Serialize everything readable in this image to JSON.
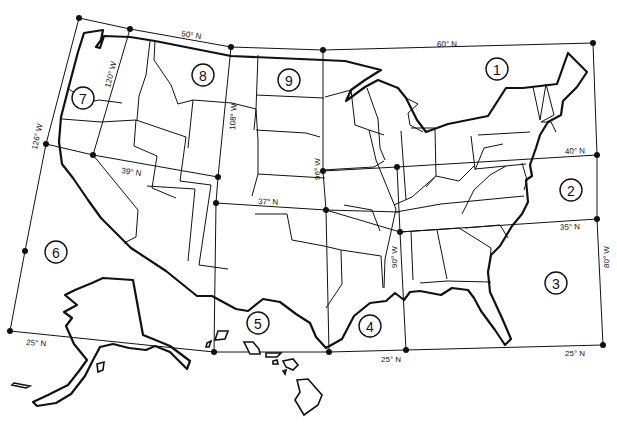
{
  "map": {
    "title": "",
    "background": "#ffffff",
    "ink_color": "#111111",
    "latitude_labels": [
      {
        "id": "lat50",
        "text": "50° N",
        "x": 181,
        "y": 36,
        "rot": 9
      },
      {
        "id": "lat60",
        "text": "60° N",
        "x": 437,
        "y": 47,
        "rot": -1
      },
      {
        "id": "lat39",
        "text": "39° N",
        "x": 121,
        "y": 173,
        "rot": 9
      },
      {
        "id": "lat37",
        "text": "37° N",
        "x": 258,
        "y": 204,
        "rot": 2
      },
      {
        "id": "lat40",
        "text": "40° N",
        "x": 565,
        "y": 154,
        "rot": -2
      },
      {
        "id": "lat35",
        "text": "35° N",
        "x": 560,
        "y": 230,
        "rot": -2
      },
      {
        "id": "lat25a",
        "text": "25° N",
        "x": 26,
        "y": 345,
        "rot": 4
      },
      {
        "id": "lat25b",
        "text": "25° N",
        "x": 381,
        "y": 362,
        "rot": 0
      },
      {
        "id": "lat25c",
        "text": "25° N",
        "x": 565,
        "y": 356,
        "rot": 0
      }
    ],
    "longitude_labels": [
      {
        "id": "lon126",
        "text": "126° W",
        "x": 37,
        "y": 150,
        "rot": -78
      },
      {
        "id": "lon120",
        "text": "120° W",
        "x": 110,
        "y": 88,
        "rot": -76
      },
      {
        "id": "lon108",
        "text": "108° W",
        "x": 235,
        "y": 130,
        "rot": 86
      },
      {
        "id": "lon96",
        "text": "96° W",
        "x": 320,
        "y": 180,
        "rot": -90
      },
      {
        "id": "lon90",
        "text": "90° W",
        "x": 397,
        "y": 268,
        "rot": 92
      },
      {
        "id": "lon80",
        "text": "80° W",
        "x": 604,
        "y": 268,
        "rot": 90
      }
    ],
    "regions": [
      {
        "id": "1",
        "label": "1",
        "x": 497,
        "y": 69
      },
      {
        "id": "2",
        "label": "2",
        "x": 571,
        "y": 190
      },
      {
        "id": "3",
        "label": "3",
        "x": 556,
        "y": 283
      },
      {
        "id": "4",
        "label": "4",
        "x": 370,
        "y": 326
      },
      {
        "id": "5",
        "label": "5",
        "x": 258,
        "y": 323
      },
      {
        "id": "6",
        "label": "6",
        "x": 56,
        "y": 252
      },
      {
        "id": "7",
        "label": "7",
        "x": 83,
        "y": 98
      },
      {
        "id": "8",
        "label": "8",
        "x": 203,
        "y": 75
      },
      {
        "id": "9",
        "label": "9",
        "x": 289,
        "y": 80
      }
    ],
    "grid_points": [
      [
        79,
        18
      ],
      [
        130,
        29
      ],
      [
        231,
        47
      ],
      [
        323,
        50
      ],
      [
        593,
        43
      ],
      [
        46,
        144
      ],
      [
        93,
        155
      ],
      [
        218,
        177
      ],
      [
        216,
        203
      ],
      [
        323,
        171
      ],
      [
        397,
        167
      ],
      [
        597,
        155
      ],
      [
        326,
        210
      ],
      [
        400,
        232
      ],
      [
        597,
        219
      ],
      [
        25,
        251
      ],
      [
        10,
        331
      ],
      [
        214,
        352
      ],
      [
        329,
        352
      ],
      [
        406,
        350
      ],
      [
        603,
        345
      ]
    ]
  }
}
